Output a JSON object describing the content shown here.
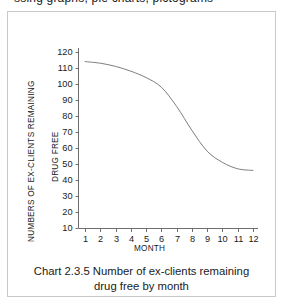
{
  "top_clipped_text": "ssing graphs, pie charts, pictograms",
  "figure": {
    "caption_line_1": "Chart 2.3.5  Number of ex-clients remaining",
    "caption_line_2": "drug free by month"
  },
  "colors": {
    "line": "#7d7d7d",
    "axis": "#6e6e6e",
    "text": "#1a1a1a",
    "frame": "#c9c9c9",
    "background": "#ffffff"
  },
  "chart_data": {
    "type": "line",
    "title": "Chart 2.3.5  Number of ex-clients remaining drug free by month",
    "xlabel": "MONTH",
    "ylabel": "NUMBERS OF EX-CLIENTS REMAINING",
    "ylabel_secondary": "DRUG FREE",
    "x": [
      1,
      2,
      3,
      4,
      5,
      6,
      7,
      8,
      9,
      10,
      11,
      12
    ],
    "categories": [
      "1",
      "2",
      "3",
      "4",
      "5",
      "6",
      "7",
      "8",
      "9",
      "10",
      "11",
      "12"
    ],
    "values": [
      114,
      113,
      111,
      108,
      104,
      98,
      86,
      71,
      58,
      51,
      47,
      46
    ],
    "series": [
      {
        "name": "Ex-clients remaining drug free",
        "values": [
          114,
          113,
          111,
          108,
          104,
          98,
          86,
          71,
          58,
          51,
          47,
          46
        ]
      }
    ],
    "xlim": [
      1,
      12
    ],
    "ylim": [
      0,
      125
    ],
    "yticks": [
      10,
      20,
      30,
      40,
      50,
      60,
      70,
      80,
      90,
      100,
      110,
      120
    ],
    "ytick_labels": [
      "10",
      "20",
      "30",
      "40",
      "50",
      "60",
      "70",
      "80",
      "90",
      "100",
      "110",
      "120"
    ],
    "xticks": [
      1,
      2,
      3,
      4,
      5,
      6,
      7,
      8,
      9,
      10,
      11,
      12
    ],
    "xtick_labels": [
      "1",
      "2",
      "3",
      "4",
      "5",
      "6",
      "7",
      "8",
      "9",
      "10",
      "11",
      "12"
    ],
    "grid": false,
    "legend": false,
    "markers": false,
    "smooth": true
  }
}
